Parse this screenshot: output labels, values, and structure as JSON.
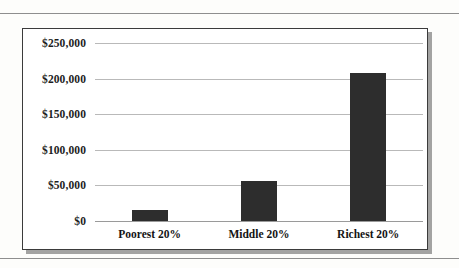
{
  "page": {
    "background_color": "#fdfdfb",
    "rule_color": "#8e8e8e"
  },
  "chart_frame": {
    "border_color": "#3b3b3b",
    "background_color": "#ffffff"
  },
  "chart_data": {
    "type": "bar",
    "title": "",
    "subtitle": "",
    "xlabel": "",
    "ylabel": "",
    "categories": [
      "Poorest 20%",
      "Middle 20%",
      "Richest 20%"
    ],
    "values": [
      16000,
      56000,
      208000
    ],
    "ylim": [
      0,
      250000
    ],
    "ytick_values": [
      0,
      50000,
      100000,
      150000,
      200000,
      250000
    ],
    "ytick_labels": [
      "$0",
      "$50,000",
      "$100,000",
      "$150,000",
      "$200,000",
      "$250,000"
    ],
    "bar_color": "#2d2d2d",
    "grid": true,
    "grid_color": "#b9b9b9",
    "legend": null,
    "legend_position": "none",
    "annotations": []
  }
}
